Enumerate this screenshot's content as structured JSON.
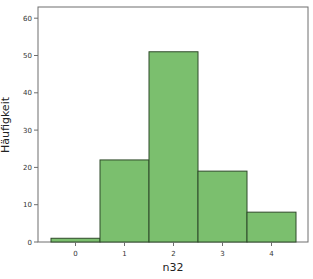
{
  "chart_data": {
    "type": "bar",
    "subtype": "histogram",
    "title": "",
    "xlabel": "n32",
    "ylabel": "Häufigkeit",
    "categories": [
      "0",
      "1",
      "2",
      "3",
      "4"
    ],
    "values": [
      1,
      22,
      51,
      19,
      8
    ],
    "ylim": [
      0,
      63
    ],
    "yticks": [
      0,
      10,
      20,
      30,
      40,
      50,
      60
    ],
    "grid": false,
    "legend": null,
    "bar_color": "#7bbf6e",
    "bar_edge_color": "#2f4a2a"
  }
}
